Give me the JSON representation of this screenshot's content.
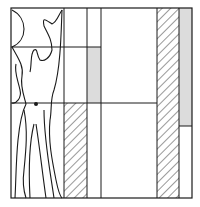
{
  "diagram": {
    "colors": {
      "background": "#ffffff",
      "line": "#1a1a1a",
      "grey_fill": "#dcdcdc",
      "hatch": "#333333"
    },
    "frame": {
      "x": 11,
      "y": 8,
      "width": 181,
      "height": 190
    },
    "vertical_lines": [
      64,
      87,
      101,
      157,
      179
    ],
    "horizontal_lines": [
      {
        "y": 47,
        "x1": 11,
        "x2": 101
      },
      {
        "y": 103,
        "x1": 11,
        "x2": 157
      },
      {
        "y": 126,
        "x1": 179,
        "x2": 192
      }
    ],
    "grey_blocks": [
      {
        "name": "middle-grey-block",
        "x": 87,
        "y": 47,
        "width": 14,
        "height": 56
      },
      {
        "name": "right-grey-column",
        "x": 179,
        "y": 8,
        "width": 13,
        "height": 118
      }
    ],
    "hatched_blocks": [
      {
        "name": "lower-hatched-column",
        "x": 64,
        "y": 103,
        "width": 23,
        "height": 95
      },
      {
        "name": "right-hatched-column",
        "x": 157,
        "y": 8,
        "width": 22,
        "height": 190
      }
    ],
    "figure": {
      "name": "modulor-man",
      "raised_arm": true
    }
  }
}
